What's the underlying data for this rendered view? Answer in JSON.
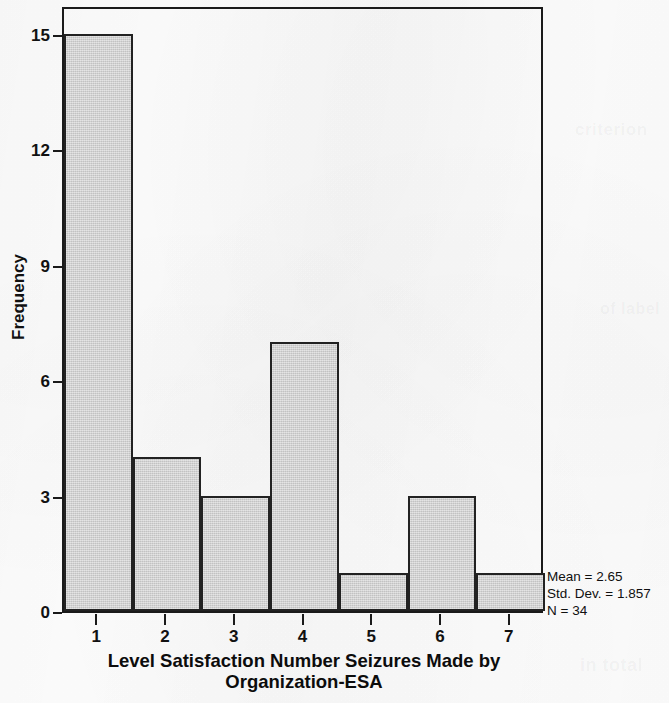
{
  "chart_data": {
    "type": "bar",
    "title": "",
    "xlabel": "Level Satisfaction Number Seizures Made by Organization-ESA",
    "ylabel": "Frequency",
    "categories": [
      "1",
      "2",
      "3",
      "4",
      "5",
      "6",
      "7"
    ],
    "values": [
      15,
      4,
      3,
      7,
      1,
      3,
      1
    ],
    "xlim": [
      0.5,
      7.5
    ],
    "ylim": [
      0,
      15.75
    ],
    "y_ticks": [
      0,
      3,
      6,
      9,
      12,
      15
    ],
    "y_tick_labels": [
      "0",
      "3",
      "6",
      "9",
      "12",
      "15"
    ],
    "x_ticks": [
      1,
      2,
      3,
      4,
      5,
      6,
      7
    ],
    "x_tick_labels": [
      "1",
      "2",
      "3",
      "4",
      "5",
      "6",
      "7"
    ],
    "grid": false,
    "legend": false,
    "bar_fill_color": "#cdcdcd",
    "bar_edge_color": "#222222",
    "axis_color": "#1a1a1a",
    "background_color": "#fdfdfd",
    "annotations": [
      "Mean = 2.65",
      "Std. Dev. = 1.857",
      "N = 34"
    ]
  },
  "axis": {
    "y_title": "Frequency",
    "x_title_line1": "Level Satisfaction Number Seizures Made by",
    "x_title_line2": "Organization-ESA"
  },
  "stats": {
    "mean": "Mean = 2.65",
    "std_dev": "Std. Dev. = 1.857",
    "n": "N = 34"
  },
  "background_ghosts": [
    {
      "text": "criterion",
      "left": 575,
      "top": 120,
      "size": 17,
      "rot": 0
    },
    {
      "text": "of label",
      "left": 600,
      "top": 300,
      "size": 16,
      "rot": 0
    },
    {
      "text": "in total",
      "left": 580,
      "top": 655,
      "size": 18,
      "rot": 0
    },
    {
      "text": "a note",
      "left": 300,
      "top": 672,
      "size": 16,
      "rot": 0
    },
    {
      "text": "Table",
      "left": 120,
      "top": 560,
      "size": 15,
      "rot": 0
    }
  ]
}
